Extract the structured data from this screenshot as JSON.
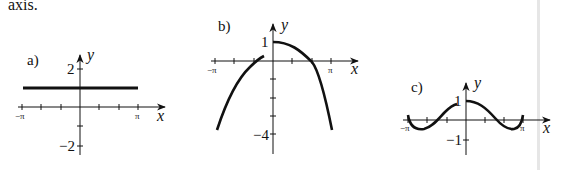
{
  "lead_text": "axis.",
  "colors": {
    "ink": "#111111",
    "page_edge": "#e6e6e6"
  },
  "figures": [
    {
      "label": "a)",
      "x_axis_label": "x",
      "y_axis_label": "y",
      "x_tick_labels": [
        "−π",
        "π"
      ],
      "y_tick_labels": [
        "2",
        "−2"
      ],
      "curve": "y = 1 (horizontal line)"
    },
    {
      "label": "b)",
      "x_axis_label": "x",
      "y_axis_label": "y",
      "x_tick_labels": [
        "−π",
        "π"
      ],
      "y_tick_labels": [
        "1",
        "−4"
      ],
      "curve": "downward parabola, peak at y = 1"
    },
    {
      "label": "c)",
      "x_axis_label": "x",
      "y_axis_label": "y",
      "x_tick_labels": [
        "−π",
        "π"
      ],
      "y_tick_labels": [
        "1",
        "−1"
      ],
      "curve": "even wave, max 1 at x = 0"
    }
  ]
}
